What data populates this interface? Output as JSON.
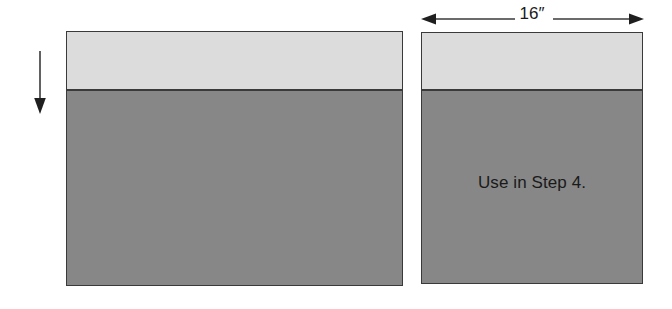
{
  "figure": {
    "background_color": "#ffffff",
    "line_color": "#3a3a3a",
    "light_fill_color": "#dcdcdc",
    "dark_fill_color": "#878787",
    "text_color": "#1a1a1a"
  },
  "dimension": {
    "label": "16″",
    "icon_left": "arrowhead-left-icon",
    "icon_right": "arrowhead-right-icon"
  },
  "flow_arrow": {
    "icon": "arrow-down-icon"
  },
  "panels": {
    "left": {
      "caption": ""
    },
    "right": {
      "caption": "Use in Step 4."
    }
  }
}
